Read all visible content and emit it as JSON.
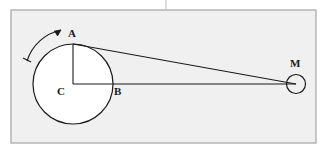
{
  "figure": {
    "title": "",
    "canvas": {
      "width": 325,
      "height": 152,
      "background": "#ffffff"
    },
    "frame": {
      "name": "diagram-border",
      "x": 11,
      "y": 10,
      "width": 305,
      "height": 133,
      "fill": "#f0f0f0",
      "stroke": "#b0b0b0",
      "stroke_width": 1.4
    },
    "top_tick": {
      "name": "top-divider-tick",
      "x": 166,
      "y1": 0,
      "y2": 10,
      "stroke": "#c8c8c8",
      "stroke_width": 1.2
    },
    "stroke_color": "#1a1a1a",
    "shape_fill": "#ffffff",
    "labels": {
      "A": "A",
      "B": "B",
      "C": "C",
      "M": "M"
    },
    "label_positions": {
      "A": {
        "x": 68,
        "y": 28
      },
      "B": {
        "x": 114,
        "y": 86
      },
      "C": {
        "x": 57,
        "y": 86
      },
      "M": {
        "x": 290,
        "y": 58
      }
    },
    "big_circle": {
      "name": "crank-disk",
      "cx": 73,
      "cy": 84,
      "r": 40,
      "stroke_width": 1.2
    },
    "small_circle": {
      "name": "mass-M",
      "cx": 296,
      "cy": 84,
      "r": 9.5,
      "stroke_width": 1.2
    },
    "points": {
      "A": {
        "x": 73,
        "y": 44
      },
      "B": {
        "x": 113,
        "y": 84
      },
      "C": {
        "x": 73,
        "y": 84
      },
      "M": {
        "x": 296,
        "y": 84
      }
    },
    "segments": [
      {
        "name": "segment-CA",
        "x1": 73,
        "y1": 84,
        "x2": 73,
        "y2": 44
      },
      {
        "name": "segment-CM",
        "x1": 73,
        "y1": 84,
        "x2": 296,
        "y2": 84
      },
      {
        "name": "segment-AM",
        "x1": 73,
        "y1": 44,
        "x2": 296,
        "y2": 84
      }
    ],
    "rotation_arrow": {
      "name": "rotation-direction-arrow",
      "path": "M 27 61 A 46 46 0 0 1 61 30",
      "arrow_tip": {
        "x": 61,
        "y": 30
      },
      "tail_tick": {
        "x1": 23,
        "y1": 58,
        "x2": 31,
        "y2": 62
      },
      "direction": "clockwise"
    }
  }
}
